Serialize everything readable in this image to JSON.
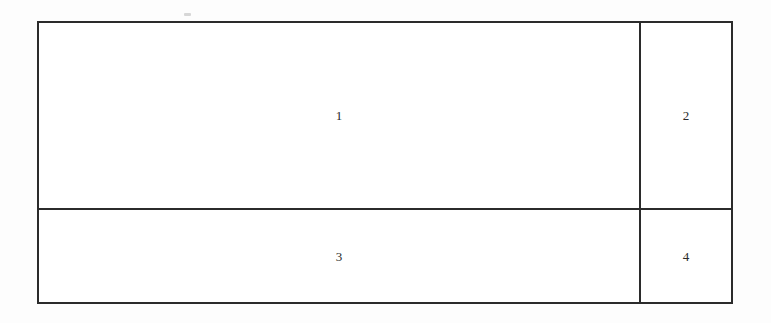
{
  "figure": {
    "name": "partitioned-rectangle",
    "line_color": "#2b2b2b",
    "background_color": "#ffffff",
    "page_color": "#fdfdfd",
    "label_color": "#2a2a2a",
    "outline": {
      "x": 37,
      "y": 21,
      "width": 696,
      "height": 283,
      "stroke_width": 2
    },
    "dividers": [
      {
        "name": "horizontal-divider",
        "orientation": "horizontal",
        "position": 208,
        "stroke_width": 2
      },
      {
        "name": "vertical-divider",
        "orientation": "vertical",
        "position": 639,
        "stroke_width": 2
      }
    ],
    "cells": [
      {
        "id": 1,
        "label": "1",
        "region": "top-left",
        "width": 600,
        "height": 185
      },
      {
        "id": 2,
        "label": "2",
        "region": "top-right",
        "width": 90,
        "height": 185
      },
      {
        "id": 3,
        "label": "3",
        "region": "bottom-left",
        "width": 600,
        "height": 92
      },
      {
        "id": 4,
        "label": "4",
        "region": "bottom-right",
        "width": 90,
        "height": 92
      }
    ],
    "artifacts": [
      {
        "name": "scan-speck",
        "x": 184,
        "y": 13,
        "width": 7,
        "height": 3
      }
    ]
  }
}
